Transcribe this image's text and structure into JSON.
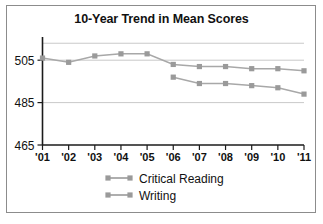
{
  "figure": {
    "background_color": "#ffffff",
    "frame_color": "#8c8c8c"
  },
  "chart_data": {
    "type": "line",
    "title": "10-Year Trend in Mean Scores",
    "xlabel": "",
    "ylabel": "",
    "x": [
      "'01",
      "'02",
      "'03",
      "'04",
      "'05",
      "'06",
      "'07",
      "'08",
      "'09",
      "'10",
      "'11"
    ],
    "categories": [
      "'01",
      "'02",
      "'03",
      "'04",
      "'05",
      "'06",
      "'07",
      "'08",
      "'09",
      "'10",
      "'11"
    ],
    "ylim": [
      465,
      515
    ],
    "yticks": [
      465,
      485,
      505
    ],
    "ytick_labels": [
      "465",
      "485",
      "505"
    ],
    "gridlines": [
      485,
      505,
      513
    ],
    "grid": true,
    "legend_position": "bottom",
    "series": [
      {
        "name": "Critical Reading",
        "color": "#9a9a9a",
        "values": [
          506,
          504,
          507,
          508,
          508,
          503,
          502,
          502,
          501,
          501,
          500
        ]
      },
      {
        "name": "Writing",
        "color": "#9a9a9a",
        "values": [
          null,
          null,
          null,
          null,
          null,
          497,
          494,
          494,
          493,
          492,
          489
        ]
      }
    ]
  },
  "legend": {
    "items": [
      {
        "label": "Critical Reading"
      },
      {
        "label": "Writing"
      }
    ]
  }
}
